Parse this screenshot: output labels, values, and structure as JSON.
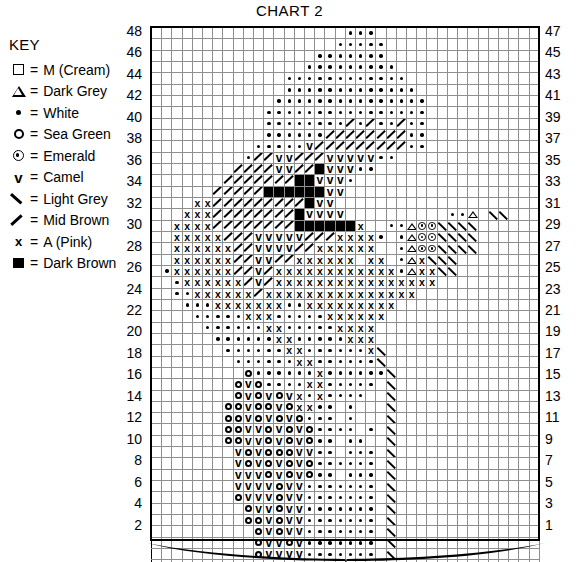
{
  "title": "CHART 2",
  "key": {
    "heading": "KEY",
    "equals": "=",
    "items": [
      {
        "symbol": "square-outline",
        "label": "M (Cream)"
      },
      {
        "symbol": "triangle-outline",
        "label": "Dark Grey"
      },
      {
        "symbol": "dot",
        "label": "White"
      },
      {
        "symbol": "circle-outline",
        "label": "Sea Green"
      },
      {
        "symbol": "circle-dot",
        "label": "Emerald"
      },
      {
        "symbol": "vee",
        "label": "Camel"
      },
      {
        "symbol": "backslash",
        "label": "Light Grey"
      },
      {
        "symbol": "slash",
        "label": "Mid Brown"
      },
      {
        "symbol": "cross",
        "label": "A (Pink)"
      },
      {
        "symbol": "filled-square",
        "label": "Dark Brown"
      }
    ]
  },
  "glyph_text": {
    "vee": "v",
    "cross": "x"
  },
  "chart": {
    "columns": 38,
    "rows": 48,
    "row_numbers_left": [
      48,
      46,
      44,
      42,
      40,
      38,
      36,
      34,
      32,
      30,
      28,
      26,
      24,
      22,
      20,
      18,
      16,
      14,
      12,
      10,
      8,
      6,
      4,
      2
    ],
    "row_numbers_right": [
      47,
      45,
      43,
      41,
      39,
      37,
      35,
      33,
      31,
      29,
      27,
      25,
      23,
      21,
      19,
      17,
      15,
      13,
      11,
      9,
      7,
      5,
      3,
      1
    ],
    "legend_codes": {
      ".": "M (Cream) - blank",
      "w": "White",
      "o": "Sea Green",
      "e": "Emerald",
      "v": "Camel",
      "l": "Light Grey",
      "m": "Mid Brown",
      "x": "A (Pink)",
      "b": "Dark Brown",
      "t": "Dark Grey"
    },
    "rows_data": [
      "...................www................",
      "..................wwwww...............",
      "................wwwwwww...............",
      "...............wwwwwwwww..............",
      ".............wwwwwwwwwwww.............",
      ".............wwwwwwwwwwwww............",
      "............wwwwwwwwwwwwwww...........",
      "...........wwwwwwwwwwwwwwww...........",
      "...........wwwwwwwwmwmwwmww...........",
      "...........wwwwwwmmmmmmmmww...........",
      "..........wwwwwvmmmmmmmmmww...........",
      ".........wmmvvmmmvvvvvww..............",
      "........mmmmvvmmbvvvww................",
      ".......mmmmmmmbbvvvw..................",
      "......mmmmmbbbbbbvv...................",
      "....xxmmmmmmmmmbvv....................",
      "...xxxmmmmmmmmbvvvv..........wwt.ll...",
      "..xxxxmmmmmmmmbbbbbbx..wwteellll......",
      "..xxxxxmmmvvvvvmmmxxxxw.wteellll......",
      "..xxxxxxmmvvvvmmxxxxxx..wteellll......",
      "..xxxxxxmmvvmmxxxxxx.xx.wtxlll........",
      ".wxxxxxxmmvmxxxxxxxxxxxxwtxxll........",
      "..wxxxxxxmvmxxxxxxxxxxxxxxxx..........",
      "..wwxxxxxxmxxxxxxxxxxxxxxx............",
      "...wwwxxxxxxxwwxxxxxxxxx..............",
      "....wwwwwxxxwwwwwxxxxxx...............",
      ".....wwwwwwxxwwwwwxxxx................",
      "......wwwwwwxxwwwwwxxx................",
      ".......wwwwwwxxwwwwwwxl...............",
      "........wwwwwwxxwwwwwwl...............",
      ".........owwwwwwxwwwwwwl..............",
      "........ovowwwwxxwwwww.l..............",
      "........ovovovxwxwwww..l..............",
      ".......oovoovoxxww.w...l..............",
      ".......oovovovowww.w...l..............",
      ".......oovvovovowwww.w.l..............",
      ".......oovvovovoww.ww..l..............",
      "........vovooovvww.www.l..............",
      "........vovovovowwwwww.l..............",
      "........vvvovovoww.www.l..............",
      "........vvvvovvwwwwwww.l..............",
      "........ovvvovvwwwwwww.l..............",
      ".........ovvovvwwwwwww.l..............",
      ".........oovovvwwwwwww.l..............",
      "..........ovovvwwwwwww.l..............",
      "..........ovvovwwwwwww.l..............",
      "..........ovvvvwwwwwww.l..............",
      "..................ttttt..............."
    ]
  }
}
